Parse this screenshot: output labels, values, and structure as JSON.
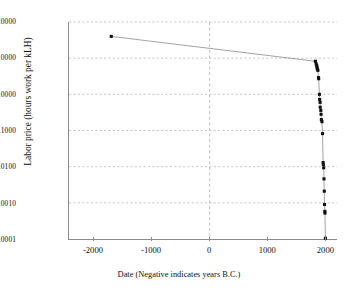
{
  "chart_data": {
    "type": "scatter",
    "title": "",
    "xlabel": "Date (Negative indicates years B.C.)",
    "ylabel": "Labor price (hours work per kLH)",
    "yscale": "log",
    "xscale": "linear",
    "xlim": [
      -2430,
      2200
    ],
    "ylim": [
      0.0001,
      100
    ],
    "grid": "dashed gridlines at each y decade and at x = 0",
    "legend": "none",
    "xticks": [
      -2000,
      -1000,
      0,
      1000,
      2000
    ],
    "xticklabels": [
      "-2000",
      "-1000",
      "0",
      "1000",
      "2000"
    ],
    "yticks": [
      0.0001,
      0.001,
      0.01,
      0.1,
      1,
      10,
      100
    ],
    "yticklabels": [
      "0.0001",
      "0.0010",
      "0.0100",
      "0.1000",
      "1.0000",
      "10.0000",
      "100.0000"
    ],
    "marker": "filled square",
    "marker_color": "#101010",
    "line_color": "#7a7a7a",
    "connected": true,
    "points": [
      {
        "x": -1700,
        "y": 40
      },
      {
        "x": 1827,
        "y": 8.2
      },
      {
        "x": 1840,
        "y": 7.0
      },
      {
        "x": 1850,
        "y": 6.2
      },
      {
        "x": 1855,
        "y": 5.6
      },
      {
        "x": 1860,
        "y": 5.0
      },
      {
        "x": 1870,
        "y": 4.6
      },
      {
        "x": 1880,
        "y": 2.9
      },
      {
        "x": 1883,
        "y": 2.7
      },
      {
        "x": 1896,
        "y": 1.0
      },
      {
        "x": 1900,
        "y": 0.72
      },
      {
        "x": 1908,
        "y": 0.6
      },
      {
        "x": 1910,
        "y": 0.44
      },
      {
        "x": 1920,
        "y": 0.36
      },
      {
        "x": 1925,
        "y": 0.28
      },
      {
        "x": 1930,
        "y": 0.2
      },
      {
        "x": 1940,
        "y": 0.175
      },
      {
        "x": 1950,
        "y": 0.082
      },
      {
        "x": 1960,
        "y": 0.013
      },
      {
        "x": 1965,
        "y": 0.0115
      },
      {
        "x": 1970,
        "y": 0.0093
      },
      {
        "x": 1975,
        "y": 0.0046
      },
      {
        "x": 1980,
        "y": 0.0021
      },
      {
        "x": 1985,
        "y": 0.0009
      },
      {
        "x": 1990,
        "y": 0.00058
      },
      {
        "x": 1992,
        "y": 0.00052
      },
      {
        "x": 2000,
        "y": 0.000105
      }
    ]
  },
  "axes": {
    "y_title": "Labor price (hours work per kLH)",
    "x_title": "Date (Negative indicates years B.C.)"
  },
  "colors": {
    "axis": "#8c8c8c",
    "grid": "#b9b9b9",
    "marker": "#101010",
    "line": "#7a7a7a",
    "background": "#ffffff",
    "text": "#111111"
  }
}
